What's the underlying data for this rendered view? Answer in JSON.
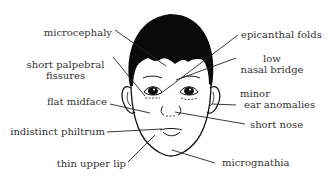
{
  "diagram": {
    "colors": {
      "ink": "#111111",
      "text": "#333333",
      "background": "#ffffff"
    },
    "labels_left": [
      {
        "id": "microcephaly",
        "text": "microcephaly"
      },
      {
        "id": "short-palpebral-fissures",
        "line1": "short palpebral",
        "line2": "fissures"
      },
      {
        "id": "flat-midface",
        "text": "flat midface"
      },
      {
        "id": "indistinct-philtrum",
        "text": "indistinct philtrum"
      },
      {
        "id": "thin-upper-lip",
        "text": "thin upper lip"
      }
    ],
    "labels_right": [
      {
        "id": "epicanthal-folds",
        "text": "epicanthal folds"
      },
      {
        "id": "low-nasal-bridge",
        "line1": "low",
        "line2": "nasal bridge"
      },
      {
        "id": "minor-ear-anomalies",
        "line1": "minor",
        "line2": "ear anomalies"
      },
      {
        "id": "short-nose",
        "text": "short nose"
      },
      {
        "id": "micrognathia",
        "text": "micrognathia"
      }
    ]
  }
}
